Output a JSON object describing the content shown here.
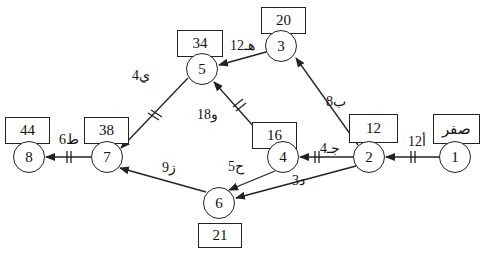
{
  "diagram": {
    "type": "activity-on-arrow network",
    "nodes": [
      {
        "id": "1",
        "label": "1",
        "time": "صفر"
      },
      {
        "id": "2",
        "label": "2",
        "time": "12"
      },
      {
        "id": "3",
        "label": "3",
        "time": "20"
      },
      {
        "id": "4",
        "label": "4",
        "time": "16"
      },
      {
        "id": "5",
        "label": "5",
        "time": "34"
      },
      {
        "id": "6",
        "label": "6",
        "time": "21"
      },
      {
        "id": "7",
        "label": "7",
        "time": "38"
      },
      {
        "id": "8",
        "label": "8",
        "time": "44"
      }
    ],
    "edges": [
      {
        "from": "1",
        "to": "2",
        "label": "أ12",
        "critical": true
      },
      {
        "from": "2",
        "to": "3",
        "label": "ب8",
        "critical": false
      },
      {
        "from": "2",
        "to": "4",
        "label": "جـ4",
        "critical": true
      },
      {
        "from": "2",
        "to": "6",
        "label": "د3",
        "critical": false
      },
      {
        "from": "3",
        "to": "5",
        "label": "هـ12",
        "critical": false
      },
      {
        "from": "4",
        "to": "5",
        "label": "و18",
        "critical": true
      },
      {
        "from": "4",
        "to": "6",
        "label": "ح5",
        "critical": false
      },
      {
        "from": "5",
        "to": "7",
        "label": "ي4",
        "critical": true
      },
      {
        "from": "6",
        "to": "7",
        "label": "ز9",
        "critical": false
      },
      {
        "from": "7",
        "to": "8",
        "label": "ط6",
        "critical": true
      }
    ]
  }
}
